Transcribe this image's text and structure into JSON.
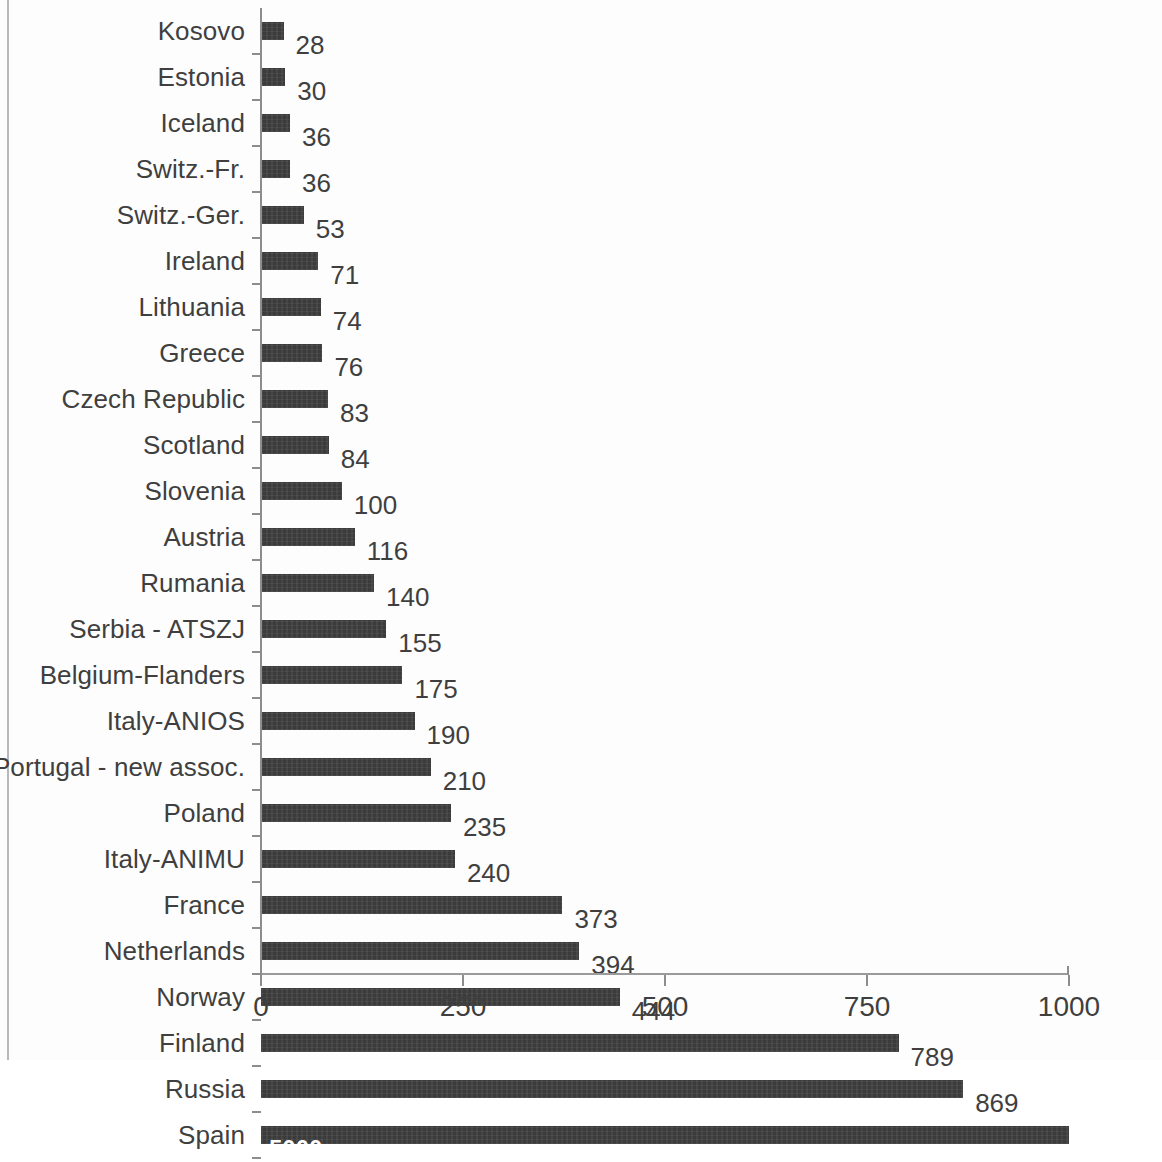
{
  "chart_data": {
    "type": "bar",
    "orientation": "horizontal",
    "title": "",
    "subtitle": "",
    "xlabel": "",
    "ylabel": "",
    "xlim": [
      0,
      1000
    ],
    "xticks": [
      "0",
      "250",
      "500",
      "750",
      "1000"
    ],
    "xtick_values": [
      0,
      250,
      500,
      750,
      1000
    ],
    "grid": false,
    "legend": null,
    "bar_color": "#3b3b3b",
    "label_color": "#3f3f3f",
    "axis_color": "#8d8d8d",
    "inside_label_color": "#ffffff",
    "note": "Spain's bar is clipped at the axis maximum of 1000; its value label 5000 is drawn in white inside the bar.",
    "categories": [
      "Kosovo",
      "Estonia",
      "Iceland",
      "Switz.-Fr.",
      "Switz.-Ger.",
      "Ireland",
      "Lithuania",
      "Greece",
      "Czech Republic",
      "Scotland",
      "Slovenia",
      "Austria",
      "Rumania",
      "Serbia - ATSZJ",
      "Belgium-Flanders",
      "Italy-ANIOS",
      "Portugal - new assoc.",
      "Poland",
      "Italy-ANIMU",
      "France",
      "Netherlands",
      "Norway",
      "Finland",
      "Russia",
      "Spain"
    ],
    "values": [
      28,
      30,
      36,
      36,
      53,
      71,
      74,
      76,
      83,
      84,
      100,
      116,
      140,
      155,
      175,
      190,
      210,
      235,
      240,
      373,
      394,
      444,
      789,
      869,
      5000
    ],
    "value_labels": [
      "28",
      "30",
      "36",
      "36",
      "53",
      "71",
      "74",
      "76",
      "83",
      "84",
      "100",
      "116",
      "140",
      "155",
      "175",
      "190",
      "210",
      "235",
      "240",
      "373",
      "394",
      "444",
      "789",
      "869",
      "5000"
    ],
    "rows": [
      {
        "label": "Kosovo",
        "value": 28,
        "value_label": "28",
        "label_inside": false
      },
      {
        "label": "Estonia",
        "value": 30,
        "value_label": "30",
        "label_inside": false
      },
      {
        "label": "Iceland",
        "value": 36,
        "value_label": "36",
        "label_inside": false
      },
      {
        "label": "Switz.-Fr.",
        "value": 36,
        "value_label": "36",
        "label_inside": false
      },
      {
        "label": "Switz.-Ger.",
        "value": 53,
        "value_label": "53",
        "label_inside": false
      },
      {
        "label": "Ireland",
        "value": 71,
        "value_label": "71",
        "label_inside": false
      },
      {
        "label": "Lithuania",
        "value": 74,
        "value_label": "74",
        "label_inside": false
      },
      {
        "label": "Greece",
        "value": 76,
        "value_label": "76",
        "label_inside": false
      },
      {
        "label": "Czech Republic",
        "value": 83,
        "value_label": "83",
        "label_inside": false
      },
      {
        "label": "Scotland",
        "value": 84,
        "value_label": "84",
        "label_inside": false
      },
      {
        "label": "Slovenia",
        "value": 100,
        "value_label": "100",
        "label_inside": false
      },
      {
        "label": "Austria",
        "value": 116,
        "value_label": "116",
        "label_inside": false
      },
      {
        "label": "Rumania",
        "value": 140,
        "value_label": "140",
        "label_inside": false
      },
      {
        "label": "Serbia - ATSZJ",
        "value": 155,
        "value_label": "155",
        "label_inside": false
      },
      {
        "label": "Belgium-Flanders",
        "value": 175,
        "value_label": "175",
        "label_inside": false
      },
      {
        "label": "Italy-ANIOS",
        "value": 190,
        "value_label": "190",
        "label_inside": false
      },
      {
        "label": "Portugal - new assoc.",
        "value": 210,
        "value_label": "210",
        "label_inside": false
      },
      {
        "label": "Poland",
        "value": 235,
        "value_label": "235",
        "label_inside": false
      },
      {
        "label": "Italy-ANIMU",
        "value": 240,
        "value_label": "240",
        "label_inside": false
      },
      {
        "label": "France",
        "value": 373,
        "value_label": "373",
        "label_inside": false
      },
      {
        "label": "Netherlands",
        "value": 394,
        "value_label": "394",
        "label_inside": false
      },
      {
        "label": "Norway",
        "value": 444,
        "value_label": "444",
        "label_inside": false
      },
      {
        "label": "Finland",
        "value": 789,
        "value_label": "789",
        "label_inside": false
      },
      {
        "label": "Russia",
        "value": 869,
        "value_label": "869",
        "label_inside": false
      },
      {
        "label": "Spain",
        "value": 5000,
        "value_label": "5000",
        "label_inside": true
      }
    ]
  }
}
